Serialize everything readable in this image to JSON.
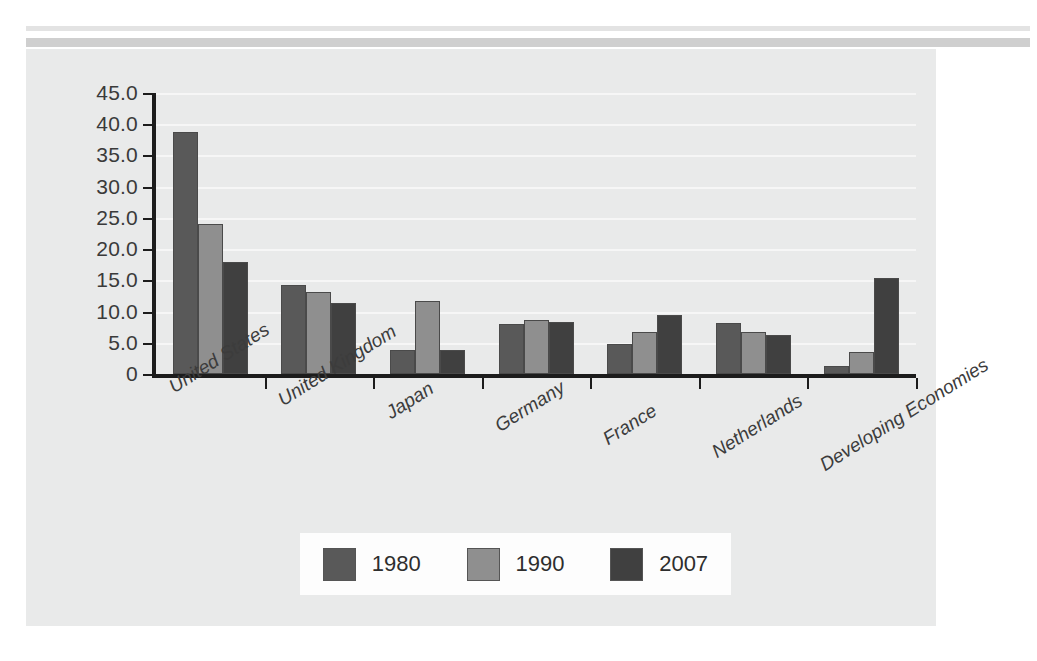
{
  "chart_data": {
    "type": "bar",
    "title": "",
    "subtitle": "",
    "xlabel": "",
    "ylabel": "",
    "ylim": [
      0,
      45
    ],
    "ytick_step": 5,
    "grid": true,
    "legend_position": "bottom",
    "categories": [
      "United States",
      "United Kingdom",
      "Japan",
      "Germany",
      "France",
      "Netherlands",
      "Developing Economies"
    ],
    "ytick_labels": [
      "0",
      "5.0",
      "10.0",
      "15.0",
      "20.0",
      "25.0",
      "30.0",
      "35.0",
      "40.0",
      "45.0"
    ],
    "ytick_values": [
      0,
      5,
      10,
      15,
      20,
      25,
      30,
      35,
      40,
      45
    ],
    "series": [
      {
        "name": "1980",
        "color": "#595959",
        "values": [
          38.8,
          14.3,
          3.8,
          8.0,
          4.8,
          8.1,
          1.3
        ]
      },
      {
        "name": "1990",
        "color": "#8f8f8f",
        "values": [
          24.0,
          13.1,
          11.7,
          8.6,
          6.8,
          6.7,
          3.5
        ]
      },
      {
        "name": "2007",
        "color": "#404040",
        "values": [
          18.0,
          11.4,
          3.8,
          8.3,
          9.4,
          6.2,
          15.4
        ]
      }
    ]
  },
  "legend": {
    "items": [
      {
        "label": "1980",
        "color": "#595959"
      },
      {
        "label": "1990",
        "color": "#8f8f8f"
      },
      {
        "label": "2007",
        "color": "#404040"
      }
    ]
  },
  "colors": {
    "panel_background": "#e9eaea",
    "page_background": "#ffffff",
    "axis": "#1c1c1c",
    "gridline": "#f6f6f6",
    "legend_background": "#fdfdfd",
    "text": "#3a3a3a"
  }
}
